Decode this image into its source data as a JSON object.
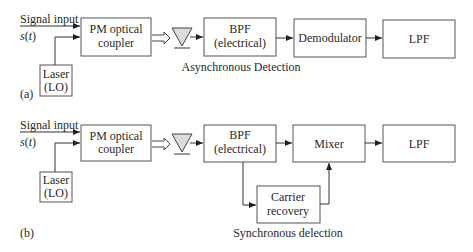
{
  "diagram_a": {
    "panel_label": "(a)",
    "caption": "Asynchronous Detection",
    "signal_input": "Signal input",
    "signal_symbol_s": "s",
    "signal_symbol_t": "t",
    "laser": [
      "Laser",
      "(LO)"
    ],
    "coupler": [
      "PM optical",
      "coupler"
    ],
    "bpf": [
      "BPF",
      "(electrical)"
    ],
    "demodulator": "Demodulator",
    "lpf": "LPF"
  },
  "diagram_b": {
    "panel_label": "(b)",
    "caption": "Synchronous delection",
    "signal_input": "Signal input",
    "signal_symbol_s": "s",
    "signal_symbol_t": "t",
    "laser": [
      "Laser",
      "(LO)"
    ],
    "coupler": [
      "PM optical",
      "coupler"
    ],
    "bpf": [
      "BPF",
      "(electrical)"
    ],
    "mixer": "Mixer",
    "lpf": "LPF",
    "carrier_recovery": [
      "Carrier",
      "recovery"
    ]
  },
  "colors": {
    "stroke": "#555555",
    "photodetector_fill": "#dcdcdc",
    "text": "#2a2a2a"
  }
}
